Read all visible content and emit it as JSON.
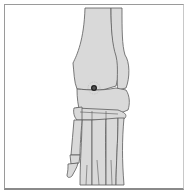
{
  "figure": {
    "colors": {
      "bone_fill": "#d9d9d9",
      "outline": "#5a5a5a",
      "frame": "#9a9a9a",
      "background": "#ffffff",
      "marker": "#222222"
    },
    "marker": {
      "label": "point-marker",
      "x": 94,
      "y": 88
    }
  }
}
